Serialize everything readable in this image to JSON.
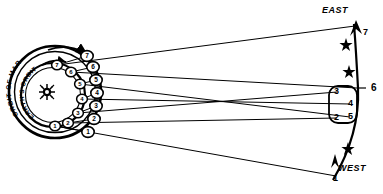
{
  "diagram": {
    "type": "astronomical-diagram",
    "colors": {
      "ink": "#000000",
      "background": "#ffffff"
    }
  },
  "orbits": {
    "outer": {
      "label": "ORBIT OF MARS",
      "direction": "counterclockwise"
    },
    "inner": {
      "label": "EARTH'S ORBIT",
      "direction": "counterclockwise"
    }
  },
  "sun": {
    "name": "sun-symbol",
    "cx": 47,
    "cy": 92
  },
  "mars_positions": [
    {
      "label": "1",
      "cx": 88,
      "cy": 132
    },
    {
      "label": "2",
      "cx": 94,
      "cy": 119
    },
    {
      "label": "3",
      "cx": 96,
      "cy": 106
    },
    {
      "label": "4",
      "cx": 97,
      "cy": 93
    },
    {
      "label": "5",
      "cx": 96,
      "cy": 80
    },
    {
      "label": "6",
      "cx": 93,
      "cy": 67
    },
    {
      "label": "7",
      "cx": 87,
      "cy": 56
    }
  ],
  "earth_positions": [
    {
      "label": "1",
      "cx": 55,
      "cy": 126
    },
    {
      "label": "2",
      "cx": 68,
      "cy": 123
    },
    {
      "label": "3",
      "cx": 78,
      "cy": 113
    },
    {
      "label": "4",
      "cx": 82,
      "cy": 99
    },
    {
      "label": "5",
      "cx": 80,
      "cy": 84
    },
    {
      "label": "6",
      "cx": 71,
      "cy": 72
    },
    {
      "label": "7",
      "cx": 57,
      "cy": 65
    }
  ],
  "sky": {
    "east_label": "EAST",
    "west_label": "WEST",
    "apparent_positions": [
      {
        "label": "7",
        "x": 361,
        "y": 33
      },
      {
        "label": "6",
        "x": 370,
        "y": 88
      },
      {
        "label": "3",
        "x": 337,
        "y": 92
      },
      {
        "label": "4",
        "x": 351,
        "y": 104
      },
      {
        "label": "5",
        "x": 351,
        "y": 117
      },
      {
        "label": "2",
        "x": 337,
        "y": 118
      },
      {
        "label": "1",
        "x": 336,
        "y": 178
      }
    ],
    "stars": [
      {
        "x": 346,
        "y": 44
      },
      {
        "x": 349,
        "y": 71
      },
      {
        "x": 348,
        "y": 148
      }
    ],
    "retrograde_loop": "2-3-4-5 cluster"
  }
}
